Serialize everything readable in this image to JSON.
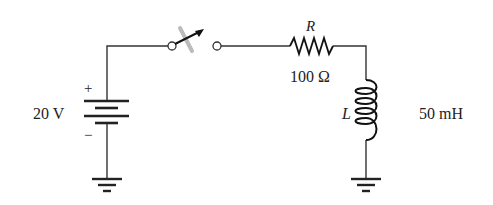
{
  "diagram": {
    "type": "circuit-schematic",
    "colors": {
      "wire": "#333333",
      "text": "#222222",
      "switch_shadow": "#bbbbbb",
      "background": "#ffffff"
    },
    "components": {
      "source": {
        "kind": "dc-battery",
        "value_label": "20 V",
        "positive_label": "+",
        "negative_label": "−"
      },
      "switch": {
        "kind": "spst-switch",
        "state": "closing"
      },
      "resistor": {
        "symbol_label": "R",
        "value_label": "100 Ω"
      },
      "inductor": {
        "symbol_label": "L",
        "value_label": "50 mH"
      },
      "grounds": [
        {
          "position": "below-source"
        },
        {
          "position": "below-inductor"
        }
      ]
    }
  }
}
